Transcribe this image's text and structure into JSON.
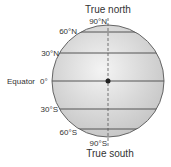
{
  "title_top": "True north",
  "title_bottom": "True south",
  "labels": {
    "n90": "90°N",
    "n60": "60°N",
    "n30": "30°N",
    "equator_name": "Equator",
    "eq": "0°",
    "s30": "30°S",
    "s60": "60°S",
    "s90": "90°S"
  },
  "colors": {
    "globe_fill": "#d4d4d4",
    "globe_highlight": "#f2f2f2",
    "lines": "#555555",
    "text": "#333333"
  }
}
